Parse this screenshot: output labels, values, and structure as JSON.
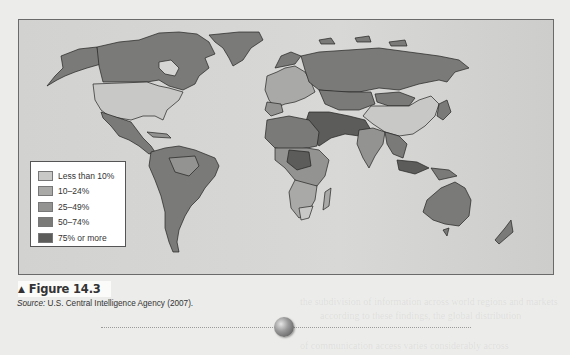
{
  "figure": {
    "label": "Figure 14.3",
    "marker_icon": "triangle-up",
    "source_prefix": "Source:",
    "source_text": " U.S. Central Intelligence Agency (2007)."
  },
  "map": {
    "type": "world choropleth",
    "legend": [
      {
        "label": "Less than 10%",
        "color": "#c8c8c6"
      },
      {
        "label": "10–24%",
        "color": "#a9a9a7"
      },
      {
        "label": "25–49%",
        "color": "#939391"
      },
      {
        "label": "50–74%",
        "color": "#7a7a78"
      },
      {
        "label": "75% or more",
        "color": "#5c5c5a"
      }
    ],
    "background_color": "#d5d5d3",
    "region_shading": {
      "United States": "Less than 10%",
      "Canada": "50–74%",
      "Greenland": "50–74%",
      "Mexico": "50–74%",
      "South America": "50–74%",
      "China": "Less than 10%",
      "Russia": "50–74%",
      "India": "25–49%",
      "Australia": "50–74%",
      "Middle East": "75% or more",
      "Southern Africa": "Less than 10%"
    }
  },
  "decor": {
    "divider_icon": "orb"
  }
}
